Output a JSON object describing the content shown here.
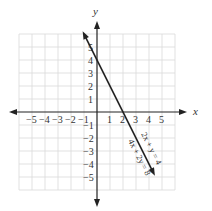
{
  "chart_data": {
    "type": "line",
    "title": "",
    "xlabel": "x",
    "ylabel": "y",
    "xlim": [
      -6,
      6
    ],
    "ylim": [
      -6,
      6
    ],
    "grid": true,
    "x_ticks": [
      -5,
      -4,
      -3,
      -2,
      -1,
      1,
      2,
      3,
      4,
      5
    ],
    "y_ticks": [
      5,
      4,
      3,
      2,
      1,
      -1,
      -2,
      -3,
      -4,
      -5
    ],
    "series": [
      {
        "name": "2x + y = 4 / 4x + 2y = 8",
        "equations": [
          "2x + y = 4",
          "4x + 2y = 8"
        ],
        "x": [
          -1,
          0,
          1,
          2,
          3,
          4
        ],
        "y": [
          6,
          4,
          2,
          0,
          -2,
          -4
        ],
        "x_intercept": 2,
        "y_intercept": 4,
        "slope": -2
      }
    ],
    "annotations": [
      "2x + y = 4",
      "4x + 2y = 8"
    ]
  },
  "labels": {
    "x_axis": "x",
    "y_axis": "y",
    "x_ticks": [
      "−5",
      "−4",
      "−3",
      "−2",
      "−1",
      "1",
      "2",
      "3",
      "4",
      "5"
    ],
    "y_ticks_pos": [
      "5",
      "4",
      "3",
      "2",
      "1"
    ],
    "y_ticks_neg": [
      "−1",
      "−2",
      "−3",
      "−4",
      "−5"
    ],
    "eq1": "2x + y = 4",
    "eq2": "4x + 2y = 8"
  },
  "colors": {
    "grid": "#d9d9d9",
    "axis": "#222222",
    "line": "#222222",
    "text": "#333333"
  }
}
